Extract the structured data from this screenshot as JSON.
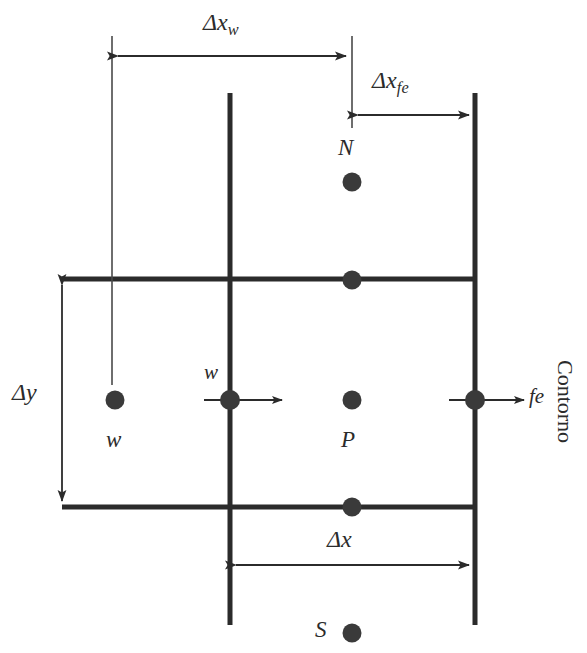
{
  "figure": {
    "type": "control-volume-mesh-diagram",
    "line_color": "#2b2b2b",
    "node_color": "#3a3a3a",
    "background": "#ffffff"
  },
  "dimensions": {
    "dx_w": {
      "symbol": "Δx",
      "subscript": "w"
    },
    "dx_fe": {
      "symbol": "Δx",
      "subscript": "fe"
    },
    "dx": {
      "symbol": "Δx",
      "subscript": ""
    },
    "dy": {
      "symbol": "Δy",
      "subscript": ""
    }
  },
  "nodes": [
    {
      "id": "node-N",
      "label": "N",
      "label_pos": "above"
    },
    {
      "id": "node-P",
      "label": "P",
      "label_pos": "below"
    },
    {
      "id": "node-S",
      "label": "S",
      "label_pos": "left"
    },
    {
      "id": "node-W",
      "label": "w",
      "label_pos": "below"
    },
    {
      "id": "node-n",
      "label": "",
      "label_pos": "none"
    },
    {
      "id": "node-s",
      "label": "",
      "label_pos": "none"
    }
  ],
  "faces": [
    {
      "id": "face-w",
      "label": "w",
      "label_pos": "above-left",
      "flux_arrow": "right"
    },
    {
      "id": "face-fe",
      "label": "fe",
      "label_pos": "right",
      "flux_arrow": "right"
    }
  ],
  "annotations": {
    "boundary": "Contorno"
  }
}
